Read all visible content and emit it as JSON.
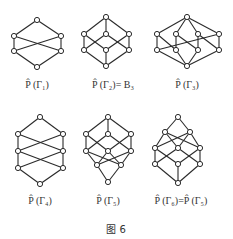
{
  "figure": {
    "caption": "图 6",
    "lattices": [
      {
        "id": "g1",
        "label": "P̂ (Γ₁)",
        "label_pos": [
          37,
          85
        ],
        "nodes": [
          [
            37,
            20
          ],
          [
            14,
            36
          ],
          [
            61,
            36
          ],
          [
            14,
            51
          ],
          [
            61,
            51
          ],
          [
            37,
            67
          ]
        ],
        "edges": [
          [
            0,
            1
          ],
          [
            0,
            2
          ],
          [
            1,
            3
          ],
          [
            2,
            4
          ],
          [
            1,
            4
          ],
          [
            2,
            3
          ],
          [
            3,
            5
          ],
          [
            4,
            5
          ]
        ]
      },
      {
        "id": "g2",
        "label": "P̂ (Γ₂)= B₃",
        "label_pos": [
          113,
          85
        ],
        "nodes": [
          [
            106,
            17
          ],
          [
            84,
            34
          ],
          [
            106,
            34
          ],
          [
            129,
            34
          ],
          [
            84,
            50
          ],
          [
            106,
            50
          ],
          [
            129,
            50
          ],
          [
            106,
            66
          ]
        ],
        "edges": [
          [
            0,
            1
          ],
          [
            0,
            2
          ],
          [
            0,
            3
          ],
          [
            1,
            4
          ],
          [
            1,
            5
          ],
          [
            2,
            4
          ],
          [
            2,
            6
          ],
          [
            3,
            5
          ],
          [
            3,
            6
          ],
          [
            4,
            7
          ],
          [
            5,
            7
          ],
          [
            6,
            7
          ]
        ]
      },
      {
        "id": "g3",
        "label": "P̂ (Γ₃)",
        "label_pos": [
          187,
          85
        ],
        "nodes": [
          [
            187,
            17
          ],
          [
            157,
            34
          ],
          [
            176,
            34
          ],
          [
            198,
            34
          ],
          [
            219,
            34
          ],
          [
            157,
            50
          ],
          [
            176,
            50
          ],
          [
            198,
            50
          ],
          [
            219,
            50
          ],
          [
            187,
            66
          ]
        ],
        "edges": [
          [
            0,
            1
          ],
          [
            0,
            2
          ],
          [
            0,
            3
          ],
          [
            0,
            4
          ],
          [
            1,
            5
          ],
          [
            1,
            6
          ],
          [
            2,
            6
          ],
          [
            2,
            7
          ],
          [
            3,
            7
          ],
          [
            3,
            8
          ],
          [
            4,
            8
          ],
          [
            4,
            5
          ],
          [
            5,
            9
          ],
          [
            6,
            9
          ],
          [
            7,
            9
          ],
          [
            8,
            9
          ]
        ]
      },
      {
        "id": "g4",
        "label": "P̂ (Γ₄)",
        "label_pos": [
          40,
          201
        ],
        "nodes": [
          [
            40,
            117
          ],
          [
            18,
            134
          ],
          [
            63,
            134
          ],
          [
            18,
            151
          ],
          [
            63,
            151
          ],
          [
            18,
            168
          ],
          [
            63,
            168
          ],
          [
            40,
            184
          ]
        ],
        "edges": [
          [
            0,
            1
          ],
          [
            0,
            2
          ],
          [
            1,
            3
          ],
          [
            2,
            4
          ],
          [
            1,
            4
          ],
          [
            2,
            3
          ],
          [
            3,
            5
          ],
          [
            4,
            6
          ],
          [
            3,
            6
          ],
          [
            4,
            5
          ],
          [
            5,
            7
          ],
          [
            6,
            7
          ]
        ]
      },
      {
        "id": "g5",
        "label": "P̂ (Γ₅)",
        "label_pos": [
          108,
          201
        ],
        "nodes": [
          [
            108,
            117
          ],
          [
            86,
            134
          ],
          [
            108,
            134
          ],
          [
            131,
            134
          ],
          [
            86,
            151
          ],
          [
            108,
            151
          ],
          [
            131,
            151
          ],
          [
            97,
            165
          ],
          [
            121,
            165
          ],
          [
            108,
            182
          ]
        ],
        "edges": [
          [
            0,
            1
          ],
          [
            0,
            2
          ],
          [
            0,
            3
          ],
          [
            1,
            4
          ],
          [
            1,
            5
          ],
          [
            2,
            4
          ],
          [
            2,
            6
          ],
          [
            3,
            5
          ],
          [
            3,
            6
          ],
          [
            4,
            7
          ],
          [
            4,
            8
          ],
          [
            5,
            7
          ],
          [
            5,
            8
          ],
          [
            6,
            7
          ],
          [
            6,
            8
          ],
          [
            7,
            9
          ],
          [
            8,
            9
          ]
        ]
      },
      {
        "id": "g6",
        "label": "P̂ (Γ₆)=P̂ (Γ₅)",
        "label_pos": [
          181,
          201
        ],
        "nodes": [
          [
            178,
            117
          ],
          [
            165,
            132
          ],
          [
            190,
            132
          ],
          [
            155,
            148
          ],
          [
            178,
            148
          ],
          [
            200,
            148
          ],
          [
            155,
            164
          ],
          [
            178,
            164
          ],
          [
            200,
            164
          ],
          [
            178,
            183
          ]
        ],
        "edges": [
          [
            0,
            1
          ],
          [
            0,
            2
          ],
          [
            1,
            3
          ],
          [
            1,
            4
          ],
          [
            1,
            5
          ],
          [
            2,
            3
          ],
          [
            2,
            4
          ],
          [
            2,
            5
          ],
          [
            3,
            6
          ],
          [
            3,
            7
          ],
          [
            4,
            6
          ],
          [
            4,
            8
          ],
          [
            5,
            7
          ],
          [
            5,
            8
          ],
          [
            6,
            9
          ],
          [
            7,
            9
          ],
          [
            8,
            9
          ]
        ]
      }
    ]
  },
  "labels": {
    "g1": "P̂ (Γ₁)",
    "g2": "P̂ (Γ₂)= B₃",
    "g3": "P̂ (Γ₃)",
    "g4": "P̂ (Γ₄)",
    "g5": "P̂ (Γ₅)",
    "g6": "P̂ (Γ₆)=P̂ (Γ₅)"
  },
  "colors": {
    "stroke": "#2a2a2a",
    "node_fill": "#ffffff",
    "background": "#ffffff"
  }
}
